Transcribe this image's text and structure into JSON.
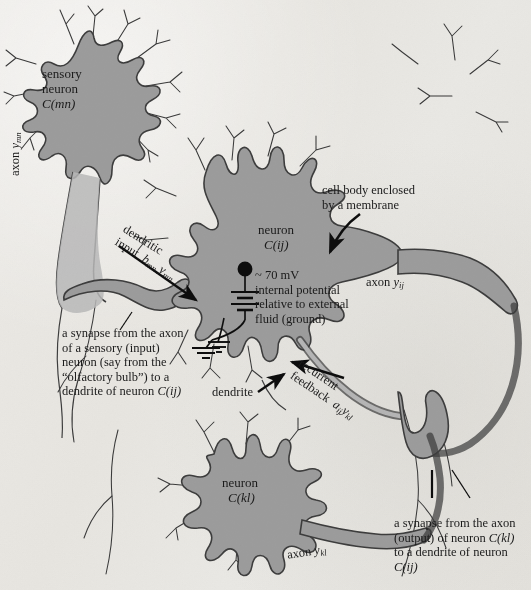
{
  "figure": {
    "colors": {
      "soma_fill": "#9c9c9c",
      "soma_stroke": "#3d3d3d",
      "background": "#e8e7e3",
      "text": "#1a1a1a",
      "arrow": "#111111"
    }
  },
  "labels": {
    "sensory_neuron": {
      "line1": "sensory",
      "line2": "neuron",
      "line3": "C(mn)"
    },
    "axon_mn": {
      "text": "axon",
      "symbol": "y",
      "subscript": "mn"
    },
    "dendritic_input": {
      "line1": "dendritic",
      "line2": "input",
      "sym1": "b",
      "sub1": "mn",
      "sym2": "y",
      "sub2": "mn"
    },
    "neuron_ij": {
      "line1": "neuron",
      "line2": "C(ij)"
    },
    "membrane_potential": {
      "line1": "~ 70 mV",
      "line2": "internal potential",
      "line3": "relative to external",
      "line4": "fluid (ground)"
    },
    "cell_body_callout": {
      "line1": "cell body enclosed",
      "line2": "by a membrane"
    },
    "axon_ij": {
      "text": "axon",
      "symbol": "y",
      "subscript": "ij"
    },
    "synapse_sensory": {
      "line1": "a synapse from the axon",
      "line2": "of a sensory (input)",
      "line3": "neuron (say from the",
      "line4": "“olfactory bulb”) to a",
      "line5_pre": "dendrite of neuron ",
      "line5_em": "C(ij)"
    },
    "dendrite": {
      "text": "dendrite"
    },
    "recurrent_feedback": {
      "line1": "recurrent",
      "line2": "feedback",
      "sym1": "a",
      "sub1": "ij",
      "sym2": "y",
      "sub2": "kl"
    },
    "neuron_kl": {
      "line1": "neuron",
      "line2": "C(kl)"
    },
    "axon_kl": {
      "text": "axon",
      "symbol": "y",
      "subscript": "kl"
    },
    "synapse_output": {
      "line1": "a synapse from the axon",
      "line2_pre": "(output) of neuron ",
      "line2_em": "C(kl)",
      "line3": "to a dendrite of neuron",
      "line4": "C(ij)"
    }
  }
}
